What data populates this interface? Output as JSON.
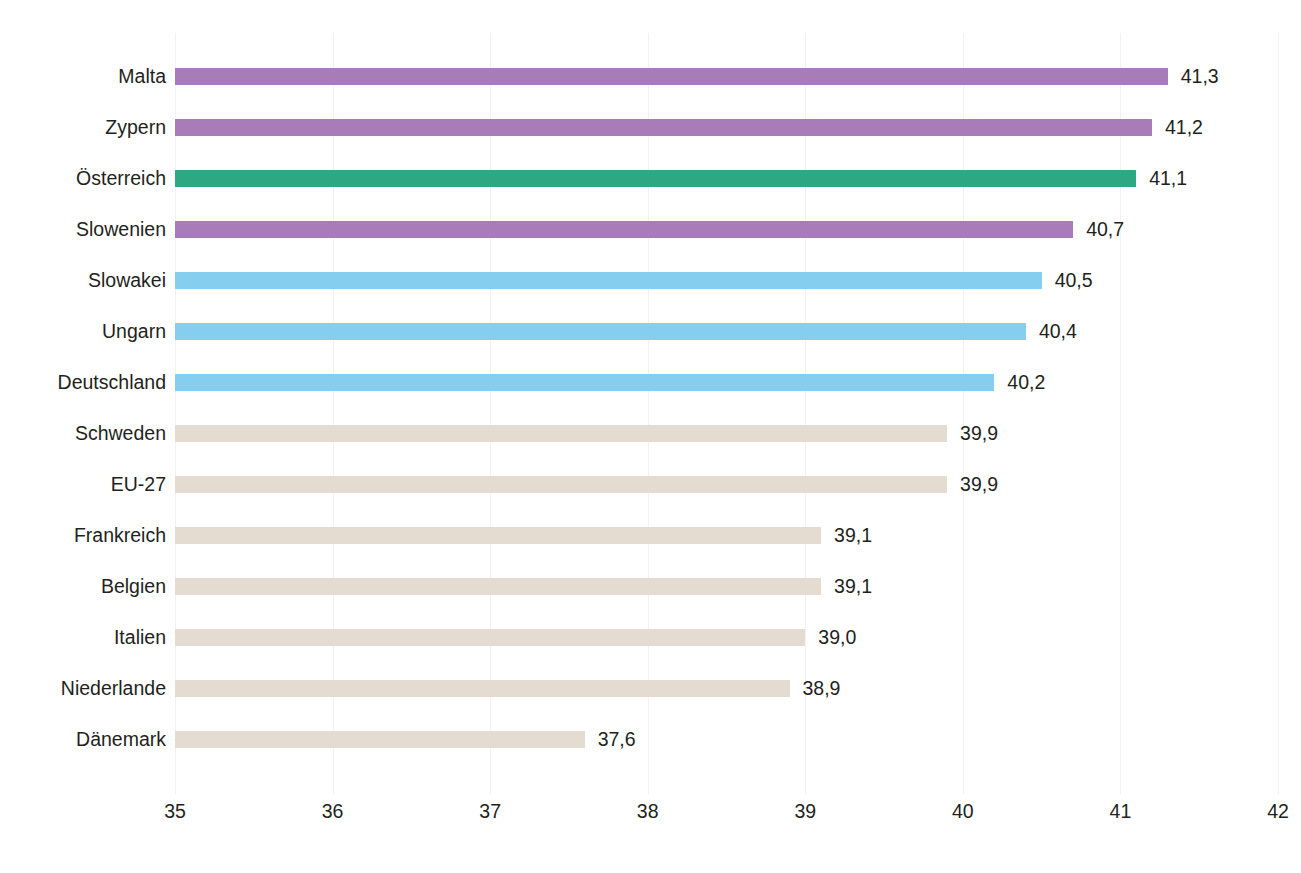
{
  "chart_data": {
    "type": "bar",
    "orientation": "horizontal",
    "title": "",
    "subtitle": "",
    "xlabel": "",
    "ylabel": "",
    "xlim": [
      35,
      42
    ],
    "xticks": [
      "35",
      "36",
      "37",
      "38",
      "39",
      "40",
      "41",
      "42"
    ],
    "grid": "vertical",
    "legend": "none",
    "decimal_separator": ",",
    "categories": [
      "Malta",
      "Zypern",
      "Österreich",
      "Slowenien",
      "Slowakei",
      "Ungarn",
      "Deutschland",
      "Schweden",
      "EU-27",
      "Frankreich",
      "Belgien",
      "Italien",
      "Niederlande",
      "Dänemark"
    ],
    "values": [
      41.3,
      41.2,
      41.1,
      40.7,
      40.5,
      40.4,
      40.2,
      39.9,
      39.9,
      39.1,
      39.1,
      39.0,
      38.9,
      37.6
    ],
    "value_labels": [
      "41,3",
      "41,2",
      "41,1",
      "40,7",
      "40,5",
      "40,4",
      "40,2",
      "39,9",
      "39,9",
      "39,1",
      "39,1",
      "39,0",
      "38,9",
      "37,6"
    ],
    "bar_colors": [
      "#a87cb9",
      "#a87cb9",
      "#2ea883",
      "#a87cb9",
      "#86cef0",
      "#86cef0",
      "#86cef0",
      "#e4dcd0",
      "#e4dcd0",
      "#e4dcd0",
      "#e4dcd0",
      "#e4dcd0",
      "#e4dcd0",
      "#e4dcd0"
    ],
    "palette": {
      "purple": "#a87cb9",
      "green": "#2ea883",
      "blue": "#86cef0",
      "beige": "#e4dcd0",
      "gridline": "#f2f2f4",
      "text": "#231f20"
    }
  },
  "caption": {
    "text": ""
  }
}
